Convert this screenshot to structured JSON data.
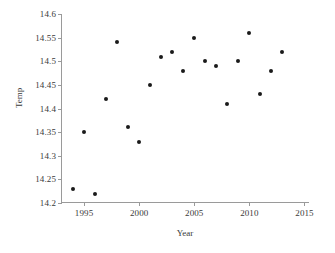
{
  "chart_data": {
    "type": "scatter",
    "title": "",
    "xlabel": "Year",
    "ylabel": "Temp",
    "xlim": [
      1993,
      2015.5
    ],
    "ylim": [
      14.2,
      14.6
    ],
    "xticks": [
      1995,
      2000,
      2005,
      2010,
      2015
    ],
    "xtick_labels": [
      "1995",
      "2000",
      "2005",
      "2010",
      "2015"
    ],
    "yticks": [
      14.2,
      14.25,
      14.3,
      14.35,
      14.4,
      14.45,
      14.5,
      14.55,
      14.6
    ],
    "ytick_labels": [
      "14.2",
      "14.25",
      "14.3",
      "14.35",
      "14.4",
      "14.45",
      "14.5",
      "14.55",
      "14.6"
    ],
    "grid": false,
    "legend": null,
    "marker_color": "#1a1a1a",
    "axis_color": "#9a9a9a",
    "x": [
      1994,
      1995,
      1996,
      1997,
      1998,
      1999,
      2000,
      2001,
      2002,
      2003,
      2004,
      2005,
      2006,
      2007,
      2008,
      2009,
      2010,
      2011,
      2012,
      2013
    ],
    "y": [
      14.23,
      14.35,
      14.22,
      14.42,
      14.54,
      14.36,
      14.33,
      14.45,
      14.51,
      14.52,
      14.48,
      14.55,
      14.5,
      14.49,
      14.41,
      14.5,
      14.56,
      14.43,
      14.48,
      14.52
    ],
    "points": [
      {
        "x": 1994,
        "y": 14.23
      },
      {
        "x": 1995,
        "y": 14.35
      },
      {
        "x": 1996,
        "y": 14.22
      },
      {
        "x": 1997,
        "y": 14.42
      },
      {
        "x": 1998,
        "y": 14.54
      },
      {
        "x": 1999,
        "y": 14.36
      },
      {
        "x": 2000,
        "y": 14.33
      },
      {
        "x": 2001,
        "y": 14.45
      },
      {
        "x": 2002,
        "y": 14.51
      },
      {
        "x": 2003,
        "y": 14.52
      },
      {
        "x": 2004,
        "y": 14.48
      },
      {
        "x": 2005,
        "y": 14.55
      },
      {
        "x": 2006,
        "y": 14.5
      },
      {
        "x": 2007,
        "y": 14.49
      },
      {
        "x": 2008,
        "y": 14.41
      },
      {
        "x": 2009,
        "y": 14.5
      },
      {
        "x": 2010,
        "y": 14.56
      },
      {
        "x": 2011,
        "y": 14.43
      },
      {
        "x": 2012,
        "y": 14.48
      },
      {
        "x": 2013,
        "y": 14.52
      }
    ]
  }
}
